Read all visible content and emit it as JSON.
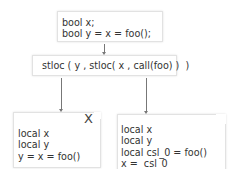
{
  "diagram": {
    "source_box": {
      "lines": [
        "bool x;",
        "bool y = x = foo();"
      ]
    },
    "il_box": {
      "text": "stloc ( y , stloc( x , call(foo) )  )"
    },
    "wrong_box": {
      "mark": "X",
      "lines": [
        "local x",
        "local y",
        "y = x = foo()"
      ]
    },
    "correct_box": {
      "lines": [
        "local x",
        "local y",
        "local csl_0 = foo()",
        "x =  csl_0",
        "y =  csl_0"
      ]
    }
  }
}
